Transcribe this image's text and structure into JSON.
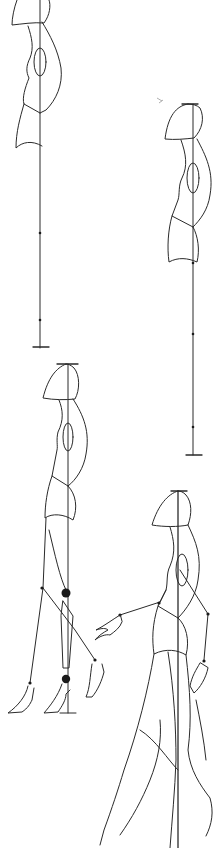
{
  "drawing": {
    "subject": "fashion croquis construction sketch",
    "figures": [
      {
        "id": 1,
        "pose": "side view standing, torso only with balance line"
      },
      {
        "id": 2,
        "pose": "side view standing, torso with balance line"
      },
      {
        "id": 3,
        "pose": "side view walking, stick legs and feet"
      },
      {
        "id": 4,
        "pose": "walking figure with arms and legs"
      }
    ],
    "colors": {
      "line": "#2a2a2a",
      "background": "#ffffff",
      "joint": "#1a1a1a"
    }
  }
}
